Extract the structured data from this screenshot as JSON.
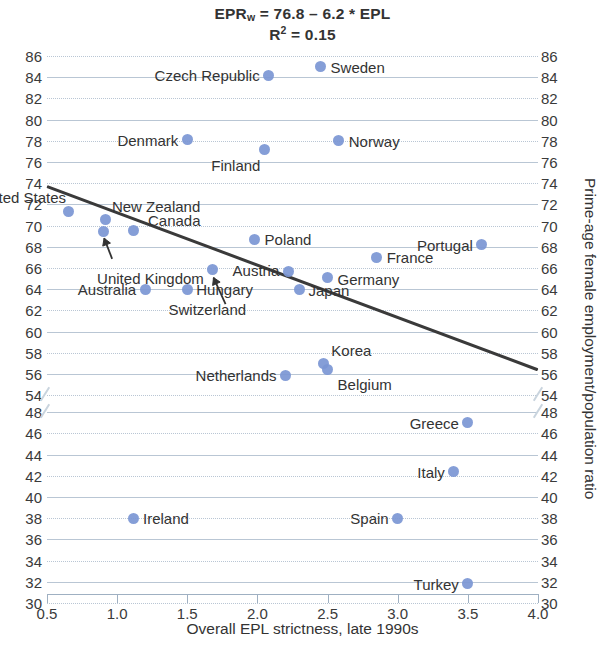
{
  "title": {
    "equation_prefix": "EPR",
    "equation_sub": "w",
    "equation_rest": " = 76.8 – 6.2 * EPL",
    "r2_prefix": "R",
    "r2_sup": "2",
    "r2_rest": " = 0.15"
  },
  "chart_data": {
    "type": "scatter",
    "title": "EPRw = 76.8 – 6.2 * EPL",
    "subtitle": "R² = 0.15",
    "xlabel": "Overall EPL strictness, late 1990s",
    "ylabel": "Prime-age female employment/population ratio",
    "xlim": [
      0.5,
      4.0
    ],
    "xticks": [
      "0.5",
      "1.0",
      "1.5",
      "2.0",
      "2.5",
      "3.0",
      "3.5",
      "4.0"
    ],
    "yticks_upper": [
      86,
      84,
      82,
      80,
      78,
      76,
      74,
      72,
      70,
      68,
      66,
      64,
      62,
      60,
      58,
      56,
      54
    ],
    "yticks_lower": [
      48,
      46,
      44,
      42,
      40,
      38,
      36,
      34,
      32,
      30
    ],
    "y_axis_break": {
      "between": [
        54,
        48
      ],
      "note": "broken axis"
    },
    "grid": true,
    "legend": "none",
    "marker_color": "#7b96d4",
    "trendline": {
      "slope": -6.2,
      "intercept": 76.8,
      "color": "#3a3a3a",
      "x_from": 0.5,
      "x_to": 4.0,
      "y_from": 73.7,
      "y_to": 52.0
    },
    "points": [
      {
        "name": "Sweden",
        "x": 2.45,
        "y": 85.0,
        "label_side": "right"
      },
      {
        "name": "Czech Republic",
        "x": 2.08,
        "y": 84.2,
        "label_side": "left"
      },
      {
        "name": "Denmark",
        "x": 1.5,
        "y": 78.1,
        "label_side": "left"
      },
      {
        "name": "Norway",
        "x": 2.58,
        "y": 78.0,
        "label_side": "right"
      },
      {
        "name": "Finland",
        "x": 2.05,
        "y": 77.2,
        "label_side": "below-left"
      },
      {
        "name": "United States",
        "x": 0.65,
        "y": 71.3,
        "label_side": "above-right"
      },
      {
        "name": "New Zealand",
        "x": 0.92,
        "y": 70.6,
        "label_side": "above-right"
      },
      {
        "name": "United Kingdom",
        "x": 0.9,
        "y": 69.4,
        "label_side": "arrow-below"
      },
      {
        "name": "Canada",
        "x": 1.12,
        "y": 69.5,
        "label_side": "above-right"
      },
      {
        "name": "Poland",
        "x": 1.98,
        "y": 68.7,
        "label_side": "right"
      },
      {
        "name": "Portugal",
        "x": 3.6,
        "y": 68.2,
        "label_side": "left"
      },
      {
        "name": "France",
        "x": 2.85,
        "y": 67.0,
        "label_side": "right"
      },
      {
        "name": "Switzerland",
        "x": 1.68,
        "y": 65.9,
        "label_side": "arrow-below"
      },
      {
        "name": "Austria",
        "x": 2.22,
        "y": 65.7,
        "label_side": "left"
      },
      {
        "name": "Germany",
        "x": 2.5,
        "y": 65.1,
        "label_side": "right"
      },
      {
        "name": "Australia",
        "x": 1.2,
        "y": 64.0,
        "label_side": "left"
      },
      {
        "name": "Hungary",
        "x": 1.5,
        "y": 64.0,
        "label_side": "right"
      },
      {
        "name": "Japan",
        "x": 2.3,
        "y": 64.0,
        "label_side": "right"
      },
      {
        "name": "Korea",
        "x": 2.47,
        "y": 57.0,
        "label_side": "above-right"
      },
      {
        "name": "Belgium",
        "x": 2.5,
        "y": 56.4,
        "label_side": "below-right"
      },
      {
        "name": "Netherlands",
        "x": 2.2,
        "y": 55.9,
        "label_side": "left"
      },
      {
        "name": "Greece",
        "x": 3.5,
        "y": 47.0,
        "label_side": "left"
      },
      {
        "name": "Italy",
        "x": 3.4,
        "y": 42.4,
        "label_side": "left"
      },
      {
        "name": "Spain",
        "x": 3.0,
        "y": 38.0,
        "label_side": "left"
      },
      {
        "name": "Ireland",
        "x": 1.12,
        "y": 38.0,
        "label_side": "right"
      },
      {
        "name": "Turkey",
        "x": 3.5,
        "y": 31.8,
        "label_side": "left"
      }
    ]
  }
}
